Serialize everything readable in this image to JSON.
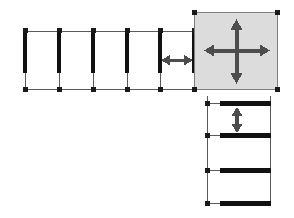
{
  "canvas": {
    "width": 294,
    "height": 218,
    "background": "#ffffff"
  },
  "colors": {
    "wall": "#111111",
    "grid_line": "#5a5a5a",
    "node": "#1a1a1a",
    "panel_fill": "#dcdcdc",
    "panel_stroke": "#777777",
    "arrow": "#4d4d4d",
    "background": "#ffffff"
  },
  "diagram": {
    "type": "structural-frame-elevation",
    "top_row": {
      "name": "upper-bay-row",
      "y_top": 31,
      "y_bottom": 90,
      "wall_top": 31,
      "wall_bottom": 73,
      "wall_thickness": 4,
      "wall_x_positions": [
        25,
        59,
        93,
        127,
        160,
        194
      ],
      "bay_count": 5,
      "node_size": 5
    },
    "panel": {
      "name": "highlighted-panel",
      "x": 194,
      "y": 12,
      "width": 84,
      "height": 78,
      "fill": "#dcdcdc",
      "stroke": "#777777"
    },
    "right_column": {
      "name": "lower-right-column",
      "x_left": 207,
      "x_right": 270,
      "bar_x_start": 220,
      "bar_x_end": 271,
      "bar_thickness": 5,
      "y_top": 96,
      "y_bottom": 206,
      "bar_y_positions": [
        103,
        135,
        170,
        203
      ],
      "node_x": 207,
      "node_size": 5
    },
    "arrows": [
      {
        "name": "horizontal-span-arrow",
        "orientation": "horizontal",
        "x1": 162,
        "x2": 192,
        "y": 60,
        "double_headed": true
      },
      {
        "name": "panel-arrow-horizontal",
        "orientation": "horizontal",
        "x1": 206,
        "x2": 268,
        "y": 51,
        "double_headed": true
      },
      {
        "name": "panel-arrow-vertical",
        "orientation": "vertical",
        "y1": 21,
        "y2": 82,
        "x": 237,
        "double_headed": true
      },
      {
        "name": "column-span-arrow",
        "orientation": "vertical",
        "y1": 108,
        "y2": 131,
        "x": 237,
        "double_headed": true
      }
    ]
  }
}
